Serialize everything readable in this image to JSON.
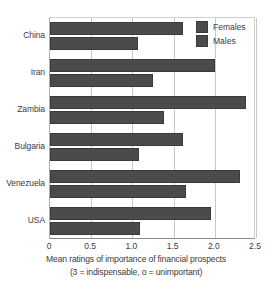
{
  "chart_data": {
    "type": "bar",
    "orientation": "horizontal",
    "title": "",
    "xlabel": "Mean ratings of importance of financial prospects",
    "xlabel_line2": "(3 = indispensable, o = unimportant)",
    "ylabel": "",
    "categories": [
      "China",
      "Iran",
      "Zambia",
      "Bulgaria",
      "Venezuela",
      "USA"
    ],
    "series": [
      {
        "name": "Females",
        "values": [
          1.62,
          2.0,
          2.38,
          1.62,
          2.3,
          1.95
        ],
        "color": "#4b4b4b"
      },
      {
        "name": "Males",
        "values": [
          1.07,
          1.25,
          1.38,
          1.08,
          1.65,
          1.09
        ],
        "color": "#4b4b4b"
      }
    ],
    "xlim": [
      0,
      2.5
    ],
    "xticks": [
      0,
      0.5,
      1.0,
      1.5,
      2.0,
      2.5
    ],
    "xticklabels": [
      "0",
      "0.5",
      "1.0",
      "1.5",
      "2.0",
      "2.5"
    ],
    "grid": true,
    "legend_position": "top-right"
  },
  "legend": {
    "items": [
      {
        "label": "Females"
      },
      {
        "label": "Males"
      }
    ]
  }
}
